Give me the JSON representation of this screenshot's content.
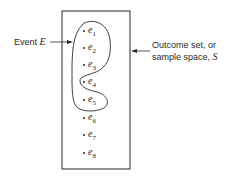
{
  "diagram": {
    "event_label": {
      "prefix": "Event ",
      "symbol": "E"
    },
    "sample_space_label": {
      "line1": "Outcome set, or",
      "line2_prefix": "sample space, ",
      "symbol": "S"
    },
    "elements": [
      {
        "base": "e",
        "sub": "1",
        "in_event": true
      },
      {
        "base": "e",
        "sub": "2",
        "in_event": true
      },
      {
        "base": "e",
        "sub": "3",
        "in_event": true
      },
      {
        "base": "e",
        "sub": "4",
        "in_event": true
      },
      {
        "base": "e",
        "sub": "5",
        "in_event": true
      },
      {
        "base": "e",
        "sub": "6",
        "in_event": false
      },
      {
        "base": "e",
        "sub": "7",
        "in_event": false
      },
      {
        "base": "e",
        "sub": "8",
        "in_event": false
      }
    ],
    "colors": {
      "stroke": "#2a2a2a",
      "background": "#ffffff"
    }
  }
}
